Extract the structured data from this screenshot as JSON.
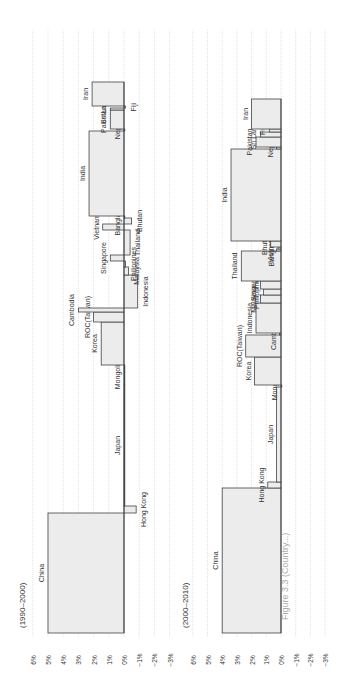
{
  "caption": "Figure 3.3 (Country...)",
  "colors": {
    "bar_fill": "#ececec",
    "bar_stroke": "#444444",
    "grid": "#cfcfcf",
    "text": "#333333",
    "leader": "#999999"
  },
  "chart_data": [
    {
      "type": "bar",
      "title": "(1990–2000)",
      "xlabel": "",
      "ylabel": "",
      "ylim": [
        -3,
        6
      ],
      "yticks": [
        "6%",
        "5%",
        "4%",
        "3%",
        "2%",
        "1%",
        "0%",
        "−1%",
        "−2%",
        "−3%"
      ],
      "grid": true,
      "variable_width": true,
      "categories": [
        "China",
        "Hong Kong",
        "Japan",
        "Mongolia",
        "Korea",
        "ROC(Taiwan)",
        "Cambodia",
        "Indonesia",
        "Malaysia",
        "Philippines",
        "Singapore",
        "Thailand",
        "Vietnam",
        "Bhutan",
        "Bangladesh",
        "India",
        "Nepal",
        "Pakistan",
        "Sri Lanka",
        "Fiji",
        "Iran"
      ],
      "values": [
        5.0,
        -0.8,
        0.0,
        0.0,
        1.5,
        2.0,
        3.0,
        -0.9,
        -0.3,
        -0.1,
        0.9,
        -0.4,
        1.4,
        -0.5,
        0.0,
        2.3,
        0.0,
        0.9,
        0.9,
        -0.1,
        2.1
      ],
      "widths": [
        120,
        7,
        121,
        20,
        43,
        10,
        4,
        33,
        8,
        6,
        6,
        25,
        6,
        6,
        2,
        85,
        2,
        19,
        2,
        2,
        24
      ]
    },
    {
      "type": "bar",
      "title": "(2000–2010)",
      "xlabel": "",
      "ylabel": "",
      "ylim": [
        -3,
        6
      ],
      "yticks": [
        "6%",
        "5%",
        "4%",
        "3%",
        "2%",
        "1%",
        "0%",
        "−1%",
        "−2%",
        "−3%"
      ],
      "grid": true,
      "variable_width": true,
      "categories": [
        "China",
        "Hong Kong",
        "Japan",
        "Mongolia",
        "Korea",
        "ROC(Taiwan)",
        "Cambodia",
        "Indonesia",
        "Malaysia",
        "Philippines",
        "Singapore",
        "Thailand",
        "Vietnam",
        "Bangladesh",
        "Bhutan",
        "India",
        "Nepal",
        "Pakistan",
        "Sri Lanka",
        "Fiji",
        "Iran"
      ],
      "values": [
        4.0,
        0.9,
        0.3,
        0.0,
        1.8,
        2.4,
        0.1,
        1.7,
        1.4,
        1.2,
        1.4,
        2.7,
        0.3,
        0.2,
        0.7,
        3.4,
        0.3,
        1.7,
        1.4,
        0.8,
        2.0
      ],
      "widths": [
        145,
        6,
        95,
        2,
        28,
        22,
        2,
        30,
        8,
        6,
        8,
        30,
        2,
        2,
        6,
        92,
        2,
        10,
        5,
        3,
        30
      ]
    }
  ]
}
